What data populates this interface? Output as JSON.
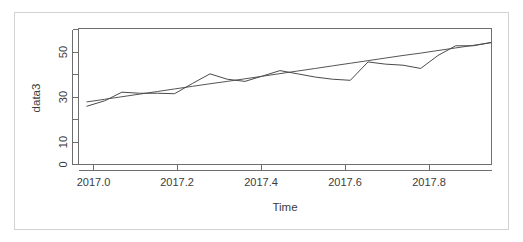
{
  "figure": {
    "background_color": "#ffffff",
    "frame_color": "#d2d2d2",
    "axis_color": "#6e6e6e",
    "series_color": "#4a4a4a",
    "trend_color": "#555555"
  },
  "chart_data": {
    "type": "line",
    "title": "",
    "subtitle": "",
    "xlabel": "Time",
    "ylabel": "data3",
    "xlim": [
      2016.98,
      2017.96
    ],
    "ylim": [
      0,
      63
    ],
    "grid": false,
    "legend": "none",
    "x_ticks": [
      2017.0,
      2017.2,
      2017.4,
      2017.6,
      2017.8
    ],
    "x_tick_labels": [
      "2017.0",
      "2017.2",
      "2017.4",
      "2017.6",
      "2017.8"
    ],
    "y_ticks": [
      0,
      10,
      20,
      30,
      40,
      50,
      60
    ],
    "y_tick_labels": [
      "0",
      "10",
      "",
      "30",
      "",
      "50",
      ""
    ],
    "x": [
      2017.0,
      2017.042,
      2017.083,
      2017.125,
      2017.167,
      2017.208,
      2017.25,
      2017.292,
      2017.333,
      2017.375,
      2017.417,
      2017.458,
      2017.5,
      2017.542,
      2017.583,
      2017.625,
      2017.667,
      2017.708,
      2017.75,
      2017.792,
      2017.833,
      2017.875,
      2017.917,
      2017.958
    ],
    "series": [
      {
        "name": "data3",
        "style": "zigzag-line",
        "values": [
          27.0,
          29.5,
          33.5,
          33.0,
          33.0,
          32.8,
          37.5,
          42.0,
          39.5,
          38.5,
          41.0,
          43.5,
          42.0,
          40.5,
          39.5,
          39.0,
          47.5,
          46.5,
          46.0,
          44.5,
          50.5,
          55.0,
          55.0,
          56.5
        ]
      },
      {
        "name": "trend",
        "style": "straight-line",
        "values": [
          29.0,
          30.2,
          31.4,
          32.6,
          33.8,
          35.0,
          36.2,
          37.4,
          38.5,
          39.7,
          40.9,
          42.1,
          43.3,
          44.5,
          45.7,
          46.9,
          48.1,
          49.3,
          50.5,
          51.6,
          52.8,
          54.0,
          55.2,
          56.4
        ]
      }
    ]
  }
}
